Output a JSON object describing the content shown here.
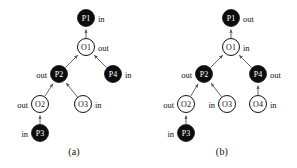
{
  "figure": {
    "background": "#ffffff",
    "node_fill_filled": "#0d0d0d",
    "node_fill_open": "#ffffff",
    "node_stroke": "#111111",
    "edge_color": "#555555",
    "label_color": "#111111"
  },
  "panels": [
    {
      "id": "a",
      "caption": "(a)",
      "nodes": [
        {
          "id": "P1",
          "label": "P1",
          "type": "filled",
          "cx": 86,
          "cy": 18,
          "r": 8.5,
          "side_label": "in",
          "side": "right"
        },
        {
          "id": "O1",
          "label": "O1",
          "type": "open",
          "cx": 86,
          "cy": 47,
          "r": 8.5,
          "side_label": "out",
          "side": "right"
        },
        {
          "id": "P2",
          "label": "P2",
          "type": "filled",
          "cx": 59,
          "cy": 74,
          "r": 8.5,
          "side_label": "out",
          "side": "left"
        },
        {
          "id": "P4",
          "label": "P4",
          "type": "filled",
          "cx": 113,
          "cy": 74,
          "r": 8.5,
          "side_label": "in",
          "side": "right"
        },
        {
          "id": "O2",
          "label": "O2",
          "type": "open",
          "cx": 40,
          "cy": 104,
          "r": 8.5,
          "side_label": "out",
          "side": "left"
        },
        {
          "id": "O3",
          "label": "O3",
          "type": "open",
          "cx": 83,
          "cy": 104,
          "r": 8.5,
          "side_label": "in",
          "side": "right"
        },
        {
          "id": "P3",
          "label": "P3",
          "type": "filled",
          "cx": 40,
          "cy": 133,
          "r": 8.5,
          "side_label": "in",
          "side": "left"
        }
      ],
      "edges": [
        {
          "from": "O1",
          "to": "P1"
        },
        {
          "from": "P2",
          "to": "O1"
        },
        {
          "from": "P4",
          "to": "O1"
        },
        {
          "from": "O2",
          "to": "P2"
        },
        {
          "from": "O3",
          "to": "P2"
        },
        {
          "from": "P3",
          "to": "O2"
        }
      ]
    },
    {
      "id": "b",
      "caption": "(b)",
      "nodes": [
        {
          "id": "P1",
          "label": "P1",
          "type": "filled",
          "cx": 83,
          "cy": 18,
          "r": 8.5,
          "side_label": "out",
          "side": "right"
        },
        {
          "id": "O1",
          "label": "O1",
          "type": "open",
          "cx": 83,
          "cy": 47,
          "r": 8.5,
          "side_label": "in",
          "side": "right"
        },
        {
          "id": "P2",
          "label": "P2",
          "type": "filled",
          "cx": 56,
          "cy": 74,
          "r": 8.5,
          "side_label": "out",
          "side": "left"
        },
        {
          "id": "P4",
          "label": "P4",
          "type": "filled",
          "cx": 110,
          "cy": 74,
          "r": 8.5,
          "side_label": "out",
          "side": "right"
        },
        {
          "id": "O2",
          "label": "O2",
          "type": "open",
          "cx": 38,
          "cy": 104,
          "r": 8.5,
          "side_label": "out",
          "side": "left"
        },
        {
          "id": "O3",
          "label": "O3",
          "type": "open",
          "cx": 79,
          "cy": 104,
          "r": 8.5,
          "side_label": "in",
          "side": "left"
        },
        {
          "id": "O4",
          "label": "O4",
          "type": "open",
          "cx": 110,
          "cy": 104,
          "r": 8.5,
          "side_label": "in",
          "side": "right"
        },
        {
          "id": "P3",
          "label": "P3",
          "type": "filled",
          "cx": 38,
          "cy": 133,
          "r": 8.5,
          "side_label": "in",
          "side": "left"
        }
      ],
      "edges": [
        {
          "from": "O1",
          "to": "P1"
        },
        {
          "from": "P2",
          "to": "O1"
        },
        {
          "from": "P4",
          "to": "O1"
        },
        {
          "from": "O2",
          "to": "P2"
        },
        {
          "from": "O3",
          "to": "P2"
        },
        {
          "from": "P3",
          "to": "O2"
        },
        {
          "from": "O4",
          "to": "P4"
        }
      ]
    }
  ]
}
